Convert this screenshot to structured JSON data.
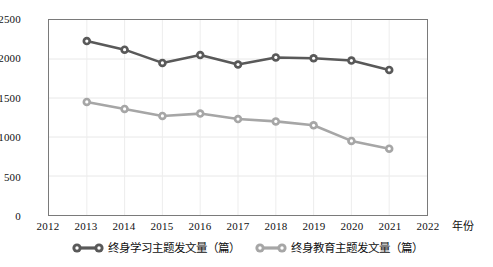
{
  "chart_data": {
    "type": "line",
    "title": "",
    "xlabel": "年份",
    "ylabel": "",
    "grid": true,
    "legend_position": "bottom",
    "x": [
      2013,
      2014,
      2015,
      2016,
      2017,
      2018,
      2019,
      2020,
      2021
    ],
    "x_ticks": [
      "2012",
      "2013",
      "2014",
      "2015",
      "2016",
      "2017",
      "2018",
      "2019",
      "2020",
      "2021",
      "2022"
    ],
    "xlim": [
      2012,
      2022
    ],
    "y_ticks": [
      "0",
      "500",
      "1000",
      "1500",
      "2000",
      "2500"
    ],
    "ylim": [
      0,
      2500
    ],
    "series": [
      {
        "name": "终身学习主题发文量（篇）",
        "color": "#595959",
        "marker_fill": "#ffffff",
        "values": [
          2230,
          2120,
          1950,
          2050,
          1930,
          2020,
          2010,
          1980,
          1860
        ]
      },
      {
        "name": "终身教育主题发文量（篇）",
        "color": "#a6a6a6",
        "marker_fill": "#ffffff",
        "values": [
          1450,
          1360,
          1270,
          1300,
          1230,
          1200,
          1150,
          950,
          850
        ]
      }
    ]
  },
  "axes": {
    "x_title": "年份"
  }
}
